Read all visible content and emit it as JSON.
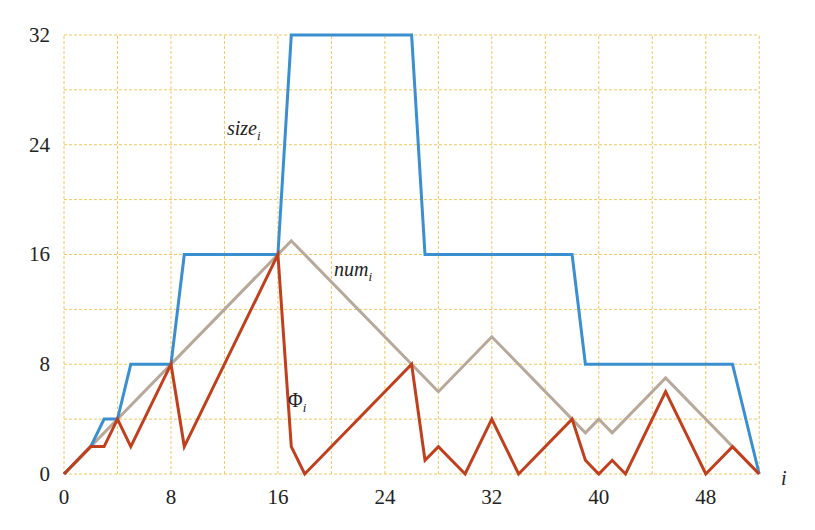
{
  "chart_data": {
    "type": "line",
    "title": "",
    "xlabel": "i",
    "ylabel": "",
    "xlim": [
      0,
      52
    ],
    "ylim": [
      0,
      32
    ],
    "x_ticks": [
      "0",
      "8",
      "16",
      "24",
      "32",
      "40",
      "48"
    ],
    "y_ticks": [
      "0",
      "8",
      "16",
      "24",
      "32"
    ],
    "grid": true,
    "grid_step_x": 4,
    "grid_step_y": 4,
    "legend": "inline labels",
    "series": [
      {
        "name": "size_i",
        "label_main": "size",
        "label_sub": "i",
        "color": "#3a8fd0",
        "points": [
          [
            0,
            0
          ],
          [
            2,
            2
          ],
          [
            3,
            4
          ],
          [
            4,
            4
          ],
          [
            5,
            8
          ],
          [
            8,
            8
          ],
          [
            9,
            16
          ],
          [
            16,
            16
          ],
          [
            17,
            32
          ],
          [
            26,
            32
          ],
          [
            27,
            16
          ],
          [
            38,
            16
          ],
          [
            39,
            8
          ],
          [
            50,
            8
          ],
          [
            52,
            0
          ]
        ]
      },
      {
        "name": "num_i",
        "label_main": "num",
        "label_sub": "i",
        "color": "#b8a89a",
        "points": [
          [
            0,
            0
          ],
          [
            17,
            17
          ],
          [
            26,
            8
          ],
          [
            28,
            6
          ],
          [
            32,
            10
          ],
          [
            39,
            3
          ],
          [
            40,
            4
          ],
          [
            41,
            3
          ],
          [
            45,
            7
          ],
          [
            52,
            0
          ]
        ]
      },
      {
        "name": "Phi_i",
        "label_main": "Φ",
        "label_sub": "i",
        "color": "#c0401e",
        "points": [
          [
            0,
            0
          ],
          [
            2,
            2
          ],
          [
            3,
            2
          ],
          [
            4,
            4
          ],
          [
            5,
            2
          ],
          [
            8,
            8
          ],
          [
            9,
            2
          ],
          [
            16,
            16
          ],
          [
            17,
            2
          ],
          [
            18,
            0
          ],
          [
            26,
            8
          ],
          [
            27,
            1
          ],
          [
            28,
            2
          ],
          [
            30,
            0
          ],
          [
            32,
            4
          ],
          [
            34,
            0
          ],
          [
            38,
            4
          ],
          [
            39,
            1
          ],
          [
            40,
            0
          ],
          [
            41,
            1
          ],
          [
            42,
            0
          ],
          [
            45,
            6
          ],
          [
            48,
            0
          ],
          [
            50,
            2
          ],
          [
            52,
            0
          ]
        ]
      }
    ],
    "annotations": [
      {
        "text": "size_i",
        "x": 14,
        "y": 25
      },
      {
        "text": "num_i",
        "x": 22,
        "y": 14
      },
      {
        "text": "Φ_i",
        "x": 19,
        "y": 5
      }
    ]
  },
  "labels": {
    "size_main": "size",
    "size_sub": "i",
    "num_main": "num",
    "num_sub": "i",
    "phi_main": "Φ",
    "phi_sub": "i",
    "x_axis": "i"
  }
}
